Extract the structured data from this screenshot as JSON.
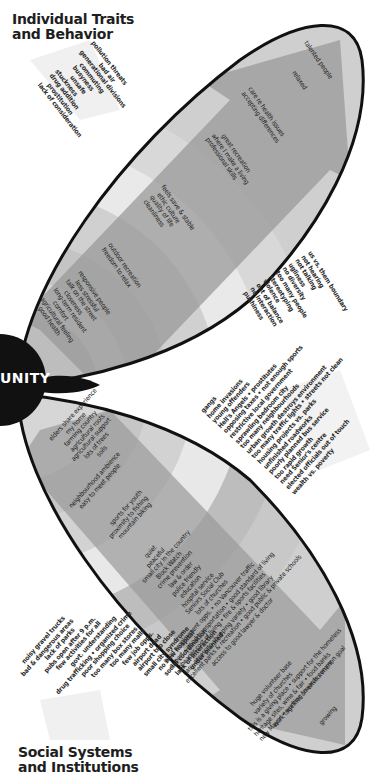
{
  "headings": {
    "top": [
      "Individual Traits",
      "and Behavior"
    ],
    "bottom": [
      "Social Systems",
      "and Institutions"
    ],
    "center": "UNITY"
  },
  "upper_ellipse": {
    "arrow_labels": [
      {
        "group": "tip_outer",
        "lines": [
          "talented people"
        ]
      },
      {
        "group": "tip",
        "lines": [
          "relaxed"
        ]
      },
      {
        "group": "band4",
        "lines": [
          "care re health issues",
          "accepting differences"
        ]
      },
      {
        "group": "band3",
        "lines": [
          "great recreation",
          "where I make a living",
          "professional skills"
        ]
      },
      {
        "group": "band2",
        "lines": [
          "feels save & stable",
          "ethic culture",
          "quality of life",
          "cleanliness"
        ]
      },
      {
        "group": "band1",
        "lines": [
          "outdoor recreation",
          "freedom to relax"
        ]
      },
      {
        "group": "base",
        "lines": [
          "responsive people",
          "less stressful",
          "talk on the street",
          "closeness",
          "long-term resident",
          "comfort",
          "agricultural feeling",
          "good health"
        ]
      }
    ],
    "outside_left": [
      "pollution threats",
      "bad air",
      "generational divisions",
      "commuting",
      "busyness",
      "unsafe",
      "stuckness",
      "drug addition",
      "prostitution",
      "lack of consideration"
    ],
    "outside_right": [
      "us vs. them boundary",
      "not hearing",
      "not talking",
      "ugliness",
      "no diversity",
      "too many people",
      "stereotyping",
      "violence",
      "out of balance",
      "no interaction",
      "pushiness"
    ]
  },
  "lower_ellipse": {
    "arrow_labels": [
      {
        "group": "base",
        "lines": [
          "elders share experience",
          "my home",
          "farming country",
          "agricultural roots",
          "agricultural support",
          "lots of trees",
          "soils"
        ]
      },
      {
        "group": "band1",
        "lines": [
          "neighbourhood ambience",
          "easy to meet people"
        ]
      },
      {
        "group": "band2",
        "lines": [
          "sports for youth",
          "proximity to fishing",
          "mountain biking"
        ]
      },
      {
        "group": "band3",
        "lines": [
          "quiet",
          "peaceful",
          "small city in the country",
          "Block Watch",
          "crime prevention",
          "law & order",
          "police friendly",
          "education",
          "hospital service",
          "Seniors Social Club",
          "lots of churches"
        ]
      },
      {
        "group": "band4",
        "lines": [
          "good employment opps. • no Vancouver traffic",
          "airport • good transportation • good standard of living",
          "cheaper cost of living • fire & sports facilities",
          "easy access to shopping variety • good library",
          "excellent parks & recreation • good public & private schools",
          "access to good lawyer & doctor"
        ]
      },
      {
        "group": "band5",
        "lines": [
          "huge volunteer base",
          "variety of churches",
          "this is a giving place • support for the homeless",
          "heritage sites, wine & fair • food banks",
          "new Mayor • working towards common goal"
        ]
      },
      {
        "group": "tip",
        "lines": [
          "work together on environment"
        ]
      },
      {
        "group": "tip_outer",
        "lines": [
          "growing"
        ]
      }
    ],
    "outside_right": [
      "gangs",
      "home invasions",
      "young offenders",
      "Hell's Angels • prostitutes",
      "opposing taxes • not enough sports",
      "restrictive local government",
      "sprawling bedroom city",
      "too many neighbourhoods",
      "urban growth destroys environment",
      "too many traffic lights • streets not clean",
      "housing projects vs. parks",
      "unfinished roadworks",
      "poorly planned bus service",
      "too rapid growth",
      "need Senior's centre",
      "elected officials out of touch",
      "wealth vs. poverty"
    ],
    "outside_left": [
      "noisy gravel trucks",
      "bad & dangerous areas",
      "lack of parks",
      "pubs open after 9 p.m.",
      "few activities for all",
      "govt. understanding",
      "drug trafficking • organized crime",
      "poor shopping choice",
      "too many box stores",
      "too many malls",
      "few job opps.",
      "airport dead",
      "airport too close",
      "small city syndrome",
      "no new hospital",
      "social coordination",
      "lack of interaction",
      "under planned"
    ]
  },
  "colors": {
    "outline": "#111111",
    "band_light": "#d9d9d9",
    "band_mid": "#bcbcbc",
    "band_dark": "#a6a6a6",
    "arrow": "#8f8f8f",
    "background_arrow": "#efefef"
  }
}
